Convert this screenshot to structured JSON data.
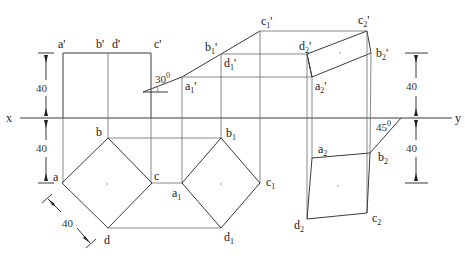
{
  "axis": {
    "left_label": "x",
    "right_label": "y"
  },
  "angles": {
    "rotation_front": "30",
    "rotation_front_sup": "0",
    "miter": "45",
    "miter_sup": "0"
  },
  "dimensions": {
    "left_upper": "40",
    "left_lower": "40",
    "right_upper": "40",
    "right_lower": "40",
    "diagonal": "40"
  },
  "front_view_1": {
    "a": "a'",
    "b": "b'",
    "d": "d'",
    "c": "c'"
  },
  "front_view_2": {
    "a": {
      "base": "a",
      "sub": "1",
      "prime": "'"
    },
    "b": {
      "base": "b",
      "sub": "1",
      "prime": "'"
    },
    "d": {
      "base": "d",
      "sub": "1",
      "prime": "'"
    },
    "c": {
      "base": "c",
      "sub": "1",
      "prime": "'"
    }
  },
  "front_view_3": {
    "a": {
      "base": "a",
      "sub": "2",
      "prime": "'"
    },
    "b": {
      "base": "b",
      "sub": "2",
      "prime": "'"
    },
    "d": {
      "base": "d",
      "sub": "2",
      "prime": "'"
    },
    "c": {
      "base": "c",
      "sub": "2",
      "prime": "'"
    }
  },
  "top_view_1": {
    "a": "a",
    "b": "b",
    "c": "c",
    "d": "d"
  },
  "top_view_2": {
    "a": {
      "base": "a",
      "sub": "1"
    },
    "b": {
      "base": "b",
      "sub": "1"
    },
    "c": {
      "base": "c",
      "sub": "1"
    },
    "d": {
      "base": "d",
      "sub": "1"
    }
  },
  "top_view_3": {
    "a": {
      "base": "a",
      "sub": "2"
    },
    "b": {
      "base": "b",
      "sub": "2"
    },
    "c": {
      "base": "c",
      "sub": "2"
    },
    "d": {
      "base": "d",
      "sub": "2"
    }
  }
}
